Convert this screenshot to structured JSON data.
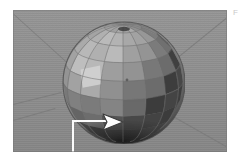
{
  "page": {
    "background_color": "#ffffff",
    "width": 240,
    "height": 166
  },
  "corner_label": {
    "text": "F",
    "color": "#c9c9c9"
  },
  "viewport": {
    "name": "3d-viewport",
    "background_color": "#8d8d8d",
    "background_top_color": "#959595",
    "background_bottom_color": "#868686",
    "border_color": "#787878",
    "grid_line_color": "#7a7a7a",
    "x": 13,
    "y": 10,
    "width": 214,
    "height": 142
  },
  "object": {
    "name": "sphere",
    "type": "faceted-uv-sphere",
    "center_x": 110,
    "center_y": 72,
    "radius": 62,
    "latitude_bands": 10,
    "longitude_segments": 16,
    "base_color": "#909090",
    "highlight_color": "#c2c2c2",
    "shadow_color": "#2b2b2b",
    "wireframe_color": "#6e6e6e",
    "selected_face_color": "#d0d0d0"
  },
  "callout": {
    "name": "leader-callout",
    "line_color": "#fbfbfb",
    "horizontal": {
      "x": 72,
      "y": 120,
      "width": 34,
      "height": 2
    },
    "vertical": {
      "x": 72,
      "y": 120,
      "width": 2,
      "height": 46
    },
    "arrow": {
      "name": "pointer-arrow",
      "direction": "right",
      "fill_color": "#fdfdfd",
      "outline_color": "#3a3a3a",
      "x": 101,
      "y": 112,
      "width": 24,
      "height": 20
    }
  },
  "grid_lines": [
    {
      "name": "grid-line-upper-left",
      "x1": 14,
      "y1": 14,
      "x2": 78,
      "y2": 72
    },
    {
      "name": "grid-line-upper-right",
      "x1": 226,
      "y1": 18,
      "x2": 162,
      "y2": 70
    },
    {
      "name": "grid-line-mid-left",
      "x1": 13,
      "y1": 104,
      "x2": 62,
      "y2": 92
    },
    {
      "name": "grid-line-lower-right",
      "x1": 166,
      "y1": 112,
      "x2": 226,
      "y2": 146
    },
    {
      "name": "grid-line-bottom-left",
      "x1": 13,
      "y1": 120,
      "x2": 55,
      "y2": 108
    }
  ]
}
